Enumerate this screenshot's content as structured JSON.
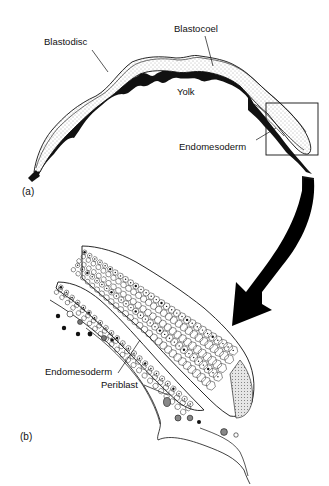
{
  "figure": {
    "panel_a": {
      "panel_label": "(a)",
      "labels": {
        "blastodisc": "Blastodisc",
        "blastocoel": "Blastocoel",
        "yolk": "Yolk",
        "endomesoderm": "Endomesoderm"
      },
      "inset_box": {
        "x": 266,
        "y": 103,
        "width": 52,
        "height": 52
      }
    },
    "panel_b": {
      "panel_label": "(b)",
      "labels": {
        "endomesoderm": "Endomesoderm",
        "periblast": "Periblast"
      }
    },
    "arrow": {
      "direction": "from inset box in (a) down-left to enlarged view (b)"
    },
    "colors": {
      "ink": "#111111",
      "stipple": "#bdbdbd",
      "background": "#ffffff"
    }
  }
}
